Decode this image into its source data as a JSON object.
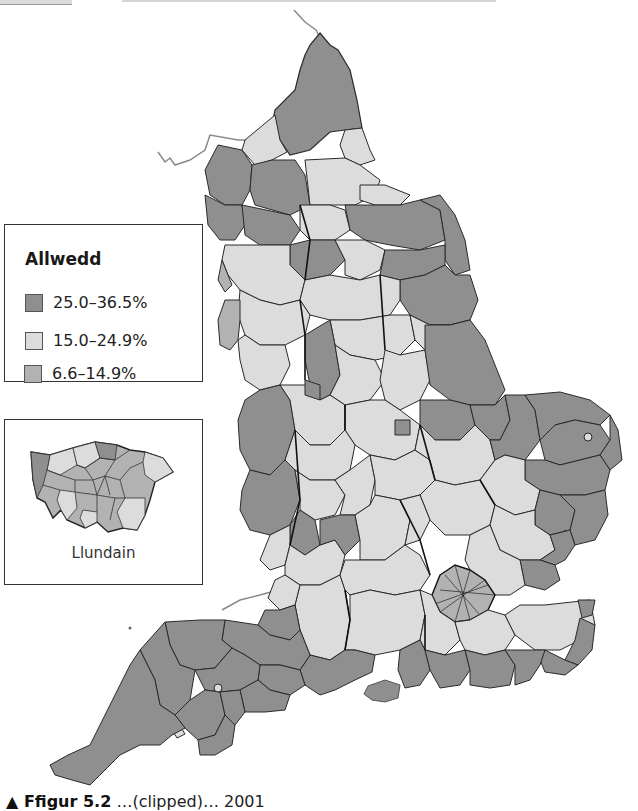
{
  "figure": {
    "type": "choropleth-map",
    "region": "England"
  },
  "legend": {
    "title": "Allwedd",
    "items": [
      {
        "label": "25.0–36.5%",
        "color": "#8f8f8f"
      },
      {
        "label": "15.0–24.9%",
        "color": "#dcdcdc"
      },
      {
        "label": "6.6–14.9%",
        "color": "#b2b2b2"
      }
    ]
  },
  "inset": {
    "label": "Llundain"
  },
  "colors": {
    "high": "#8f8f8f",
    "mid": "#dcdcdc",
    "low": "#b2b2b2",
    "border": "#2a2a2a",
    "coast_line": "#8a8a8a"
  },
  "caption": {
    "prefix": "▲ Ffigur 5.2",
    "text": "…(clipped)… 2001"
  }
}
